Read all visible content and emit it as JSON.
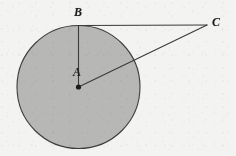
{
  "figure": {
    "kind": "circle-with-radius-and-external-point",
    "width": 236,
    "height": 156,
    "background_color": "#f3f3f1",
    "bleed_through_text": "",
    "labels": {
      "center": "A",
      "tangent_point": "B",
      "external_point": "C"
    },
    "geometry": {
      "circle": {
        "center_x": 78.5,
        "center_y": 87,
        "radius": 61.5,
        "fill_color": "#b7b7b5",
        "stroke_color": "#3d3d3d",
        "stroke_width": 1.1
      },
      "center_dot": {
        "cx": 78.5,
        "cy": 87,
        "r": 2.6,
        "color": "#1d1d1d"
      },
      "points": {
        "A": {
          "x": 78.5,
          "y": 87
        },
        "B": {
          "x": 78.5,
          "y": 25.5
        },
        "C": {
          "x": 207,
          "y": 25
        }
      },
      "segments": [
        {
          "name": "AB",
          "x1": 78.5,
          "y1": 87,
          "x2": 78.5,
          "y2": 25.5,
          "stroke": "#3a3a3a",
          "width": 1.1
        },
        {
          "name": "BC",
          "x1": 78.5,
          "y1": 25.5,
          "x2": 207,
          "y2": 25,
          "stroke": "#3a3a3a",
          "width": 1.1
        },
        {
          "name": "AC",
          "x1": 78.5,
          "y1": 87,
          "x2": 207,
          "y2": 25,
          "stroke": "#3a3a3a",
          "width": 1.1
        }
      ]
    }
  }
}
